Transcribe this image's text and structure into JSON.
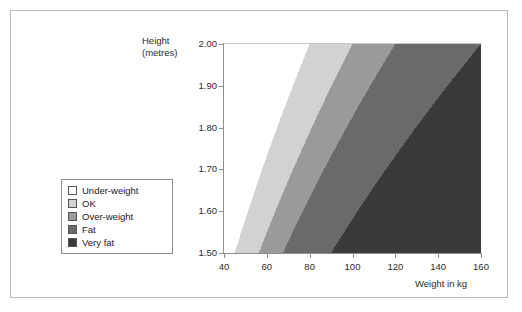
{
  "chart_data": {
    "type": "area",
    "title": "",
    "xlabel": "Weight in kg",
    "ylabel": "Height\n(metres)",
    "ylabel_line1": "Height",
    "ylabel_line2": "(metres)",
    "xlim": [
      40,
      160
    ],
    "ylim": [
      1.5,
      2.0
    ],
    "xticks": [
      40,
      60,
      80,
      100,
      120,
      140,
      160
    ],
    "yticks": [
      "1.50",
      "1.60",
      "1.70",
      "1.80",
      "1.90",
      "2.00"
    ],
    "grid": false,
    "legend_position": "left-outside",
    "bands": [
      {
        "name": "Under-weight",
        "color": "#ffffff",
        "bmi_upper": 20,
        "x_at_ymin": 45.0,
        "x_at_ymax": 80.0
      },
      {
        "name": "OK",
        "color": "#d2d2d2",
        "bmi_lower": 20,
        "bmi_upper": 25,
        "x_at_ymin": 56.3,
        "x_at_ymax": 100.0
      },
      {
        "name": "Over-weight",
        "color": "#9a9a9a",
        "bmi_lower": 25,
        "bmi_upper": 30,
        "x_at_ymin": 67.5,
        "x_at_ymax": 120.0
      },
      {
        "name": "Fat",
        "color": "#6a6a6a",
        "bmi_lower": 30,
        "bmi_upper": 40,
        "x_at_ymin": 90.0,
        "x_at_ymax": 160.0
      },
      {
        "name": "Very fat",
        "color": "#3a3a3a",
        "bmi_lower": 40
      }
    ]
  },
  "legend": {
    "items": [
      {
        "label": "Under-weight",
        "color": "#ffffff"
      },
      {
        "label": "OK",
        "color": "#d2d2d2"
      },
      {
        "label": "Over-weight",
        "color": "#9a9a9a"
      },
      {
        "label": "Fat",
        "color": "#6a6a6a"
      },
      {
        "label": "Very fat",
        "color": "#3a3a3a"
      }
    ]
  }
}
